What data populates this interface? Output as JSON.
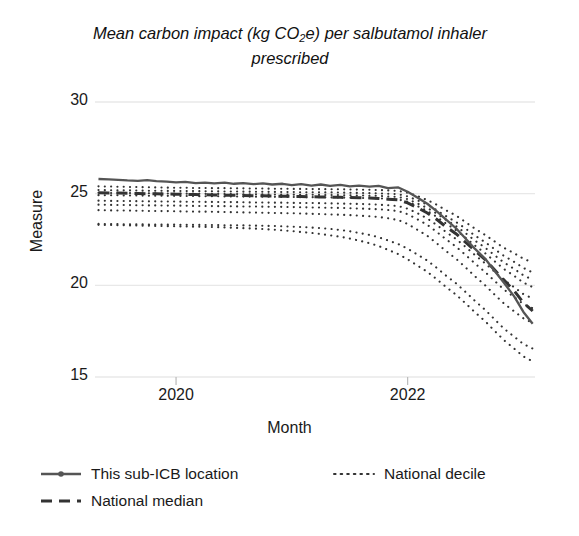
{
  "chart_data": {
    "type": "line",
    "title": "Mean carbon impact (kg CO2e) per salbutamol inhaler prescribed",
    "title_pre": "Mean carbon impact (kg CO",
    "title_sub": "2",
    "title_post": "e) per salbutamol inhaler prescribed",
    "xlabel": "Month",
    "ylabel": "Measure",
    "ylim": [
      15,
      30
    ],
    "yticks": [
      30,
      25,
      20,
      15
    ],
    "xticks": [
      "2020",
      "2022"
    ],
    "xtick_values": [
      2020,
      2022
    ],
    "xlim": [
      2019.3,
      2023.1
    ],
    "grid": true,
    "legend_position": "below",
    "colors": {
      "practice_line": "#555555",
      "median_line": "#333333",
      "decile_line": "#333333",
      "grid": "#e8e8e8"
    },
    "legend": [
      {
        "label": "This sub-ICB location",
        "style": "solid-marker"
      },
      {
        "label": "National decile",
        "style": "dotted"
      },
      {
        "label": "National median",
        "style": "dashed"
      }
    ],
    "x": [
      2019.33,
      2019.42,
      2019.5,
      2019.58,
      2019.67,
      2019.75,
      2019.83,
      2019.92,
      2020.0,
      2020.08,
      2020.17,
      2020.25,
      2020.33,
      2020.42,
      2020.5,
      2020.58,
      2020.67,
      2020.75,
      2020.83,
      2020.92,
      2021.0,
      2021.08,
      2021.17,
      2021.25,
      2021.33,
      2021.42,
      2021.5,
      2021.58,
      2021.67,
      2021.75,
      2021.83,
      2021.92,
      2022.0,
      2022.08,
      2022.17,
      2022.25,
      2022.33,
      2022.42,
      2022.5,
      2022.58,
      2022.67,
      2022.75,
      2022.83,
      2022.92,
      2023.0,
      2023.08
    ],
    "series": [
      {
        "name": "This sub-ICB location",
        "style": "solid-marker",
        "values": [
          25.8,
          25.78,
          25.75,
          25.72,
          25.7,
          25.74,
          25.68,
          25.66,
          25.62,
          25.64,
          25.58,
          25.6,
          25.56,
          25.6,
          25.54,
          25.58,
          25.52,
          25.56,
          25.5,
          25.54,
          25.46,
          25.52,
          25.44,
          25.5,
          25.42,
          25.48,
          25.4,
          25.44,
          25.38,
          25.42,
          25.3,
          25.34,
          25.1,
          24.8,
          24.45,
          24.05,
          23.6,
          23.1,
          22.55,
          22.0,
          21.45,
          20.8,
          20.15,
          19.4,
          18.55,
          17.9
        ]
      },
      {
        "name": "National median",
        "style": "dashed",
        "values": [
          25.05,
          25.04,
          25.03,
          25.02,
          25.01,
          25.0,
          24.99,
          24.98,
          24.97,
          24.96,
          24.95,
          24.94,
          24.93,
          24.92,
          24.91,
          24.9,
          24.89,
          24.88,
          24.87,
          24.86,
          24.85,
          24.84,
          24.83,
          24.82,
          24.81,
          24.8,
          24.79,
          24.78,
          24.76,
          24.74,
          24.7,
          24.66,
          24.5,
          24.25,
          23.95,
          23.6,
          23.2,
          22.8,
          22.35,
          21.9,
          21.4,
          20.85,
          20.3,
          19.7,
          19.05,
          18.6
        ]
      },
      {
        "name": "decile-90",
        "style": "dotted",
        "values": [
          25.4,
          25.39,
          25.38,
          25.37,
          25.36,
          25.35,
          25.34,
          25.33,
          25.32,
          25.32,
          25.31,
          25.31,
          25.3,
          25.3,
          25.29,
          25.29,
          25.28,
          25.28,
          25.27,
          25.27,
          25.26,
          25.26,
          25.25,
          25.25,
          25.24,
          25.24,
          25.23,
          25.22,
          25.21,
          25.2,
          25.18,
          25.15,
          25.05,
          24.88,
          24.65,
          24.4,
          24.1,
          23.8,
          23.45,
          23.1,
          22.75,
          22.4,
          22.05,
          21.75,
          21.45,
          21.25
        ]
      },
      {
        "name": "decile-80",
        "style": "dotted",
        "values": [
          25.2,
          25.19,
          25.18,
          25.18,
          25.17,
          25.16,
          25.16,
          25.15,
          25.15,
          25.14,
          25.14,
          25.13,
          25.13,
          25.12,
          25.12,
          25.11,
          25.11,
          25.1,
          25.1,
          25.09,
          25.09,
          25.08,
          25.08,
          25.07,
          25.07,
          25.06,
          25.05,
          25.04,
          25.03,
          25.02,
          25.0,
          24.97,
          24.85,
          24.65,
          24.4,
          24.1,
          23.78,
          23.45,
          23.1,
          22.72,
          22.35,
          21.98,
          21.62,
          21.28,
          20.95,
          20.7
        ]
      },
      {
        "name": "decile-70",
        "style": "dotted",
        "values": [
          25.05,
          25.04,
          25.04,
          25.03,
          25.03,
          25.02,
          25.02,
          25.01,
          25.01,
          25.0,
          25.0,
          24.99,
          24.99,
          24.98,
          24.98,
          24.97,
          24.97,
          24.96,
          24.96,
          24.95,
          24.95,
          24.94,
          24.94,
          24.93,
          24.93,
          24.92,
          24.91,
          24.9,
          24.89,
          24.88,
          24.85,
          24.82,
          24.7,
          24.48,
          24.22,
          23.92,
          23.58,
          23.22,
          22.85,
          22.45,
          22.05,
          21.65,
          21.25,
          20.9,
          20.55,
          20.3
        ]
      },
      {
        "name": "decile-60",
        "style": "dotted",
        "values": [
          24.92,
          24.91,
          24.91,
          24.9,
          24.9,
          24.89,
          24.89,
          24.88,
          24.88,
          24.87,
          24.87,
          24.86,
          24.86,
          24.85,
          24.85,
          24.84,
          24.84,
          24.83,
          24.83,
          24.82,
          24.82,
          24.81,
          24.81,
          24.8,
          24.8,
          24.79,
          24.78,
          24.77,
          24.76,
          24.74,
          24.72,
          24.68,
          24.56,
          24.34,
          24.06,
          23.74,
          23.38,
          23.0,
          22.6,
          22.18,
          21.75,
          21.32,
          20.9,
          20.52,
          20.15,
          19.9
        ]
      },
      {
        "name": "decile-40",
        "style": "dotted",
        "values": [
          24.62,
          24.61,
          24.6,
          24.6,
          24.59,
          24.58,
          24.58,
          24.57,
          24.57,
          24.56,
          24.56,
          24.55,
          24.55,
          24.54,
          24.54,
          24.53,
          24.52,
          24.52,
          24.51,
          24.51,
          24.5,
          24.49,
          24.49,
          24.48,
          24.47,
          24.46,
          24.45,
          24.44,
          24.42,
          24.4,
          24.37,
          24.32,
          24.18,
          23.95,
          23.65,
          23.3,
          22.92,
          22.52,
          22.1,
          21.66,
          21.2,
          20.75,
          20.3,
          19.9,
          19.52,
          19.28
        ]
      },
      {
        "name": "decile-30",
        "style": "dotted",
        "values": [
          24.4,
          24.39,
          24.38,
          24.38,
          24.37,
          24.36,
          24.36,
          24.35,
          24.35,
          24.34,
          24.33,
          24.33,
          24.32,
          24.32,
          24.31,
          24.3,
          24.3,
          24.29,
          24.28,
          24.28,
          24.27,
          24.26,
          24.25,
          24.24,
          24.23,
          24.22,
          24.21,
          24.19,
          24.17,
          24.15,
          24.11,
          24.05,
          23.88,
          23.62,
          23.3,
          22.92,
          22.52,
          22.1,
          21.66,
          21.2,
          20.72,
          20.25,
          19.78,
          19.36,
          18.98,
          18.75
        ]
      },
      {
        "name": "decile-20",
        "style": "dotted",
        "values": [
          24.1,
          24.09,
          24.08,
          24.08,
          24.07,
          24.06,
          24.05,
          24.05,
          24.04,
          24.03,
          24.02,
          24.02,
          24.01,
          24.0,
          23.99,
          23.98,
          23.97,
          23.96,
          23.95,
          23.94,
          23.93,
          23.92,
          23.9,
          23.89,
          23.87,
          23.85,
          23.83,
          23.8,
          23.77,
          23.73,
          23.66,
          23.56,
          23.35,
          23.05,
          22.7,
          22.3,
          21.88,
          21.44,
          20.98,
          20.5,
          20.0,
          19.5,
          19.02,
          18.58,
          18.2,
          17.95
        ]
      },
      {
        "name": "decile-10",
        "style": "dotted",
        "values": [
          23.35,
          23.34,
          23.34,
          23.33,
          23.33,
          23.32,
          23.32,
          23.31,
          23.31,
          23.3,
          23.3,
          23.29,
          23.29,
          23.28,
          23.28,
          23.27,
          23.26,
          23.25,
          23.24,
          23.22,
          23.2,
          23.18,
          23.15,
          23.12,
          23.08,
          23.02,
          22.95,
          22.86,
          22.75,
          22.62,
          22.45,
          22.25,
          22.0,
          21.7,
          21.35,
          20.96,
          20.54,
          20.1,
          19.64,
          19.16,
          18.66,
          18.15,
          17.65,
          17.2,
          16.8,
          16.55
        ]
      },
      {
        "name": "decile-5",
        "style": "dotted",
        "values": [
          23.3,
          23.29,
          23.28,
          23.27,
          23.26,
          23.25,
          23.24,
          23.23,
          23.22,
          23.21,
          23.2,
          23.19,
          23.18,
          23.16,
          23.14,
          23.12,
          23.1,
          23.07,
          23.04,
          23.0,
          22.96,
          22.91,
          22.86,
          22.8,
          22.73,
          22.65,
          22.55,
          22.44,
          22.3,
          22.14,
          21.94,
          21.7,
          21.42,
          21.1,
          20.74,
          20.34,
          19.92,
          19.48,
          19.02,
          18.54,
          18.04,
          17.52,
          17.02,
          16.55,
          16.12,
          15.85
        ]
      }
    ]
  }
}
